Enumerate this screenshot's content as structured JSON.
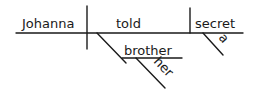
{
  "diagram": {
    "type": "sentence-diagram",
    "subject": "Johanna",
    "verb": "told",
    "direct_object": "secret",
    "direct_object_modifier": "a",
    "indirect_object": "brother",
    "indirect_object_modifier": "her",
    "colors": {
      "ink": "#1a1a1a",
      "background": "#ffffff"
    }
  }
}
